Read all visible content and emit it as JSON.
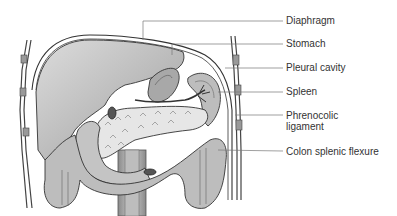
{
  "diagram": {
    "type": "anatomical-illustration",
    "labels": [
      {
        "id": "diaphragm",
        "text": "Diaphragm",
        "y": 20
      },
      {
        "id": "stomach",
        "text": "Stomach",
        "y": 43
      },
      {
        "id": "pleural-cavity",
        "text": "Pleural cavity",
        "y": 67
      },
      {
        "id": "spleen",
        "text": "Spleen",
        "y": 91
      },
      {
        "id": "phrenocolic-ligament",
        "text_line1": "Phrenocolic",
        "text_line2": "ligament",
        "y": 115
      },
      {
        "id": "colon-splenic-flexure",
        "text": "Colon splenic flexure",
        "y": 151
      }
    ],
    "colors": {
      "background": "#ffffff",
      "organ_fill": "#c8c8c8",
      "organ_dark": "#9a9a9a",
      "outline": "#333333",
      "leader_line": "#777777",
      "label_text": "#333333"
    }
  }
}
